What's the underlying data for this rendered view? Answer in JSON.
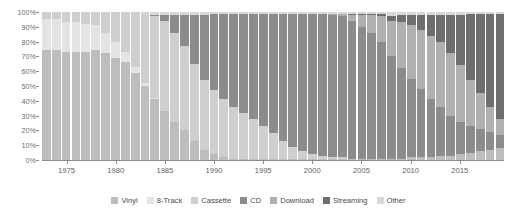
{
  "chart_data": {
    "type": "bar",
    "stacked": true,
    "normalized": "100%",
    "title": "",
    "subtitle": "",
    "xlabel": "",
    "ylabel": "",
    "ylim": [
      0,
      100
    ],
    "ytick_labels": [
      "0%",
      "10%",
      "20%",
      "30%",
      "40%",
      "50%",
      "60%",
      "70%",
      "80%",
      "90%",
      "100%"
    ],
    "ytick_values": [
      0,
      10,
      20,
      30,
      40,
      50,
      60,
      70,
      80,
      90,
      100
    ],
    "xtick_labels": [
      "1975",
      "1980",
      "1985",
      "1990",
      "1995",
      "2000",
      "2005",
      "2010",
      "2015"
    ],
    "grid": false,
    "legend_position": "bottom",
    "categories": [
      1973,
      1974,
      1975,
      1976,
      1977,
      1978,
      1979,
      1980,
      1981,
      1982,
      1983,
      1984,
      1985,
      1986,
      1987,
      1988,
      1989,
      1990,
      1991,
      1992,
      1993,
      1994,
      1995,
      1996,
      1997,
      1998,
      1999,
      2000,
      2001,
      2002,
      2003,
      2004,
      2005,
      2006,
      2007,
      2008,
      2009,
      2010,
      2011,
      2012,
      2013,
      2014,
      2015,
      2016,
      2017,
      2018,
      2019
    ],
    "series": [
      {
        "name": "Vinyl",
        "color": "#bdbdbd",
        "values": [
          74,
          74,
          73,
          73,
          73,
          74,
          72,
          69,
          66,
          58,
          50,
          41,
          33,
          26,
          20,
          13,
          7,
          4,
          2,
          1,
          1,
          1,
          1,
          1,
          1,
          1,
          1,
          1,
          1,
          1,
          1,
          1,
          1,
          1,
          1,
          1,
          1,
          2,
          2,
          2,
          3,
          3,
          4,
          5,
          6,
          7,
          8
        ]
      },
      {
        "name": "8-Track",
        "color": "#e4e4e4",
        "values": [
          21,
          21,
          20,
          20,
          19,
          17,
          14,
          11,
          7,
          4,
          2,
          1,
          0,
          0,
          0,
          0,
          0,
          0,
          0,
          0,
          0,
          0,
          0,
          0,
          0,
          0,
          0,
          0,
          0,
          0,
          0,
          0,
          0,
          0,
          0,
          0,
          0,
          0,
          0,
          0,
          0,
          0,
          0,
          0,
          0,
          0,
          0
        ]
      },
      {
        "name": "Cassette",
        "color": "#cfcfcf",
        "values": [
          5,
          5,
          7,
          7,
          8,
          9,
          14,
          20,
          27,
          37,
          47,
          55,
          61,
          60,
          57,
          52,
          47,
          43,
          39,
          35,
          31,
          27,
          22,
          17,
          12,
          8,
          5,
          3,
          2,
          1,
          1,
          0,
          0,
          0,
          0,
          0,
          0,
          0,
          0,
          0,
          0,
          0,
          0,
          0,
          0,
          0,
          0
        ]
      },
      {
        "name": "CD",
        "color": "#8c8c8c",
        "values": [
          0,
          0,
          0,
          0,
          0,
          0,
          0,
          0,
          0,
          0,
          0,
          1,
          4,
          12,
          21,
          33,
          44,
          52,
          58,
          63,
          67,
          71,
          76,
          81,
          86,
          90,
          93,
          95,
          96,
          96,
          95,
          93,
          89,
          85,
          79,
          70,
          61,
          53,
          46,
          39,
          33,
          27,
          22,
          18,
          15,
          12,
          9
        ]
      },
      {
        "name": "Download",
        "color": "#b0b0b0",
        "values": [
          0,
          0,
          0,
          0,
          0,
          0,
          0,
          0,
          0,
          0,
          0,
          0,
          0,
          0,
          0,
          0,
          0,
          0,
          0,
          0,
          0,
          0,
          0,
          0,
          0,
          0,
          0,
          0,
          0,
          1,
          2,
          4,
          8,
          12,
          17,
          24,
          31,
          36,
          40,
          43,
          44,
          42,
          38,
          31,
          24,
          17,
          11
        ]
      },
      {
        "name": "Streaming",
        "color": "#6e6e6e",
        "values": [
          0,
          0,
          0,
          0,
          0,
          0,
          0,
          0,
          0,
          0,
          0,
          0,
          0,
          0,
          0,
          0,
          0,
          0,
          0,
          0,
          0,
          0,
          0,
          0,
          0,
          0,
          0,
          0,
          0,
          0,
          0,
          1,
          1,
          1,
          2,
          3,
          5,
          7,
          10,
          14,
          18,
          26,
          34,
          45,
          54,
          63,
          71
        ]
      },
      {
        "name": "Other",
        "color": "#d8d8d8",
        "values": [
          0,
          0,
          0,
          0,
          0,
          0,
          0,
          0,
          0,
          0,
          1,
          2,
          2,
          2,
          2,
          2,
          2,
          1,
          1,
          1,
          1,
          1,
          1,
          1,
          1,
          1,
          1,
          1,
          1,
          1,
          1,
          1,
          1,
          1,
          1,
          3,
          2,
          2,
          2,
          2,
          2,
          2,
          2,
          1,
          1,
          1,
          1
        ]
      }
    ]
  },
  "legend": {
    "items": [
      {
        "label": "Vinyl",
        "color": "#bdbdbd"
      },
      {
        "label": "8-Track",
        "color": "#e4e4e4"
      },
      {
        "label": "Cassette",
        "color": "#cfcfcf"
      },
      {
        "label": "CD",
        "color": "#8c8c8c"
      },
      {
        "label": "Download",
        "color": "#b0b0b0"
      },
      {
        "label": "Streaming",
        "color": "#6e6e6e"
      },
      {
        "label": "Other",
        "color": "#d8d8d8"
      }
    ]
  }
}
